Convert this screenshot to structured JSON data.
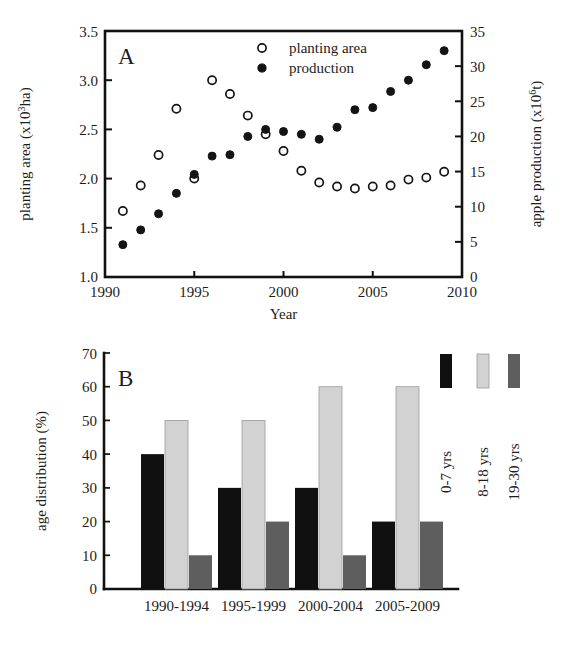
{
  "figure": {
    "caption_fragment": "",
    "panels": [
      "A",
      "B"
    ]
  },
  "panel_a": {
    "letter": "A",
    "x_axis_title": "Year",
    "y_left_title_main": "planting area (x10",
    "y_left_title_exp": "3",
    "y_left_title_tail": "ha)",
    "y_right_title_main": "apple production (x10",
    "y_right_title_exp": "6",
    "y_right_title_tail": "t)",
    "x_ticklabels": [
      "1990",
      "1995",
      "2000",
      "2005",
      "2010"
    ],
    "y_left_ticklabels": [
      "1.0",
      "1.5",
      "2.0",
      "2.5",
      "3.0",
      "3.5"
    ],
    "y_right_ticklabels": [
      "0",
      "5",
      "10",
      "15",
      "20",
      "25",
      "30",
      "35"
    ],
    "legend": [
      {
        "label": "planting area",
        "marker": "open-circle-marker"
      },
      {
        "label": "production",
        "marker": "filled-circle-marker"
      }
    ]
  },
  "panel_b": {
    "letter": "B",
    "y_title": "age distribution (%)",
    "y_ticklabels": [
      "0",
      "10",
      "20",
      "30",
      "40",
      "50",
      "60",
      "70"
    ],
    "x_ticklabels": [
      "1990-1994",
      "1995-1999",
      "2000-2004",
      "2005-2009"
    ],
    "legend": [
      {
        "label": "0-7 yrs",
        "color": "#101010"
      },
      {
        "label": "8-18 yrs",
        "color": "#d2d2d2"
      },
      {
        "label": "19-30 yrs",
        "color": "#5e5e5e"
      }
    ]
  },
  "chart_data": [
    {
      "type": "scatter",
      "panel": "A",
      "title": "",
      "xlabel": "Year",
      "ylabel": "planting area (x10^3 ha)",
      "y2label": "apple production (x10^6 t)",
      "xlim": [
        1990,
        2010
      ],
      "ylim": [
        1.0,
        3.5
      ],
      "y2lim": [
        0,
        35
      ],
      "grid": false,
      "legend_position": "top-center",
      "x": [
        1990,
        1991,
        1992,
        1993,
        1994,
        1995,
        1996,
        1997,
        1998,
        1999,
        2000,
        2001,
        2002,
        2003,
        2004,
        2005,
        2006,
        2007,
        2008,
        2009
      ],
      "series": [
        {
          "name": "planting area",
          "marker": "open circle",
          "axis": "left",
          "units": "x10^3 ha",
          "values": [
            null,
            1.67,
            1.93,
            2.24,
            2.71,
            2.0,
            3.0,
            2.86,
            2.64,
            2.45,
            2.28,
            2.08,
            1.96,
            1.92,
            1.9,
            1.92,
            1.93,
            1.99,
            2.01,
            2.07
          ]
        },
        {
          "name": "production",
          "marker": "filled circle",
          "axis": "right",
          "units": "x10^6 t",
          "values": [
            null,
            4.6,
            6.7,
            9.0,
            11.9,
            14.6,
            17.2,
            17.4,
            20.0,
            21.0,
            20.7,
            20.3,
            19.6,
            21.3,
            23.8,
            24.1,
            26.4,
            28.0,
            30.2,
            32.2
          ]
        }
      ]
    },
    {
      "type": "bar",
      "panel": "B",
      "title": "",
      "xlabel": "",
      "ylabel": "age distribution (%)",
      "ylim": [
        0,
        70
      ],
      "grid": false,
      "legend_position": "top-right",
      "categories": [
        "1990-1994",
        "1995-1999",
        "2000-2004",
        "2005-2009"
      ],
      "series": [
        {
          "name": "0-7 yrs",
          "color": "#101010",
          "values": [
            40,
            30,
            30,
            20
          ]
        },
        {
          "name": "8-18 yrs",
          "color": "#d2d2d2",
          "values": [
            50,
            50,
            60,
            60
          ]
        },
        {
          "name": "19-30 yrs",
          "color": "#5e5e5e",
          "values": [
            10,
            20,
            10,
            20
          ]
        }
      ]
    }
  ]
}
